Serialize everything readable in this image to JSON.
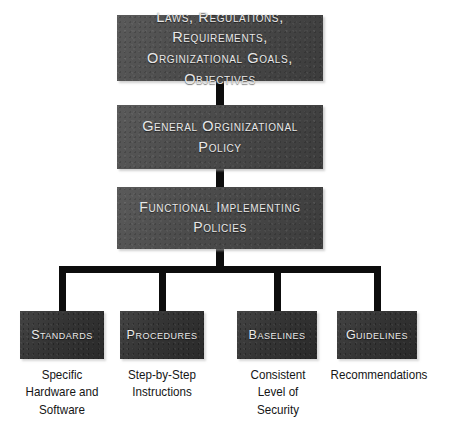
{
  "diagram": {
    "colors": {
      "page_background": "#ffffff",
      "upper_box_fill": "#4b4b4b",
      "leaf_box_fill": "#303030",
      "box_text": "#e9e9e9",
      "connector": "#0d0d0d",
      "caption_text": "#151515"
    },
    "tiers": [
      {
        "id": "drivers",
        "label_line_1": "Laws, Regulations, Requirements,",
        "label_line_2": "Orginizational Goals, Objectives"
      },
      {
        "id": "general-policy",
        "label": "General Orginizational Policy"
      },
      {
        "id": "functional-policies",
        "label": "Functional Implementing Policies"
      }
    ],
    "leaves": [
      {
        "id": "standards",
        "label": "Standards",
        "caption_lines": [
          "Specific",
          "Hardware and",
          "Software"
        ]
      },
      {
        "id": "procedures",
        "label": "Procedures",
        "caption_lines": [
          "Step-by-Step",
          "Instructions"
        ]
      },
      {
        "id": "baselines",
        "label": "Baselines",
        "caption_lines": [
          "Consistent",
          "Level of",
          "Security"
        ]
      },
      {
        "id": "guidelines",
        "label": "Guidelines",
        "caption_lines": [
          "Recommendations"
        ]
      }
    ]
  }
}
